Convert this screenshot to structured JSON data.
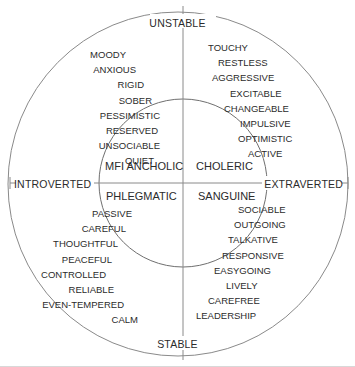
{
  "diagram": {
    "colors": {
      "stroke": "#8a8a8a",
      "text": "#2b2b2b",
      "background": "#ffffff",
      "frame": "#d8d8d8"
    },
    "axes": {
      "top_label": "UNSTABLE",
      "bottom_label": "STABLE",
      "left_label": "INTROVERTED",
      "right_label": "EXTRAVERTED"
    },
    "quadrants": [
      {
        "id": "melancholic",
        "temperament": "MFI ANCHOLIC",
        "position": "top-left",
        "traits": [
          "MOODY",
          "ANXIOUS",
          "RIGID",
          "SOBER",
          "PESSIMISTIC",
          "RESERVED",
          "UNSOCIABLE",
          "QUIET"
        ]
      },
      {
        "id": "choleric",
        "temperament": "CHOLERIC",
        "position": "top-right",
        "traits": [
          "TOUCHY",
          "RESTLESS",
          "AGGRESSIVE",
          "EXCITABLE",
          "CHANGEABLE",
          "IMPULSIVE",
          "OPTIMISTIC",
          "ACTIVE"
        ]
      },
      {
        "id": "phlegmatic",
        "temperament": "PHLEGMATIC",
        "position": "bottom-left",
        "traits": [
          "PASSIVE",
          "CAREFUL",
          "THOUGHTFUL",
          "PEACEFUL",
          "CONTROLLED",
          "RELIABLE",
          "EVEN-TEMPERED",
          "CALM"
        ]
      },
      {
        "id": "sanguine",
        "temperament": "SANGUINE",
        "position": "bottom-right",
        "traits": [
          "SOCIABLE",
          "OUTGOING",
          "TALKATIVE",
          "RESPONSIVE",
          "EASYGOING",
          "LIVELY",
          "CAREFREE",
          "LEADERSHIP"
        ]
      }
    ],
    "trait_indents": {
      "melancholic": [
        34,
        24,
        16,
        8,
        0,
        2,
        0,
        6
      ],
      "choleric": [
        12,
        22,
        16,
        34,
        28,
        44,
        42,
        52
      ],
      "phlegmatic": [
        28,
        34,
        42,
        48,
        54,
        46,
        36,
        22
      ],
      "sanguine": [
        42,
        38,
        32,
        26,
        18,
        30,
        12,
        0
      ]
    }
  }
}
